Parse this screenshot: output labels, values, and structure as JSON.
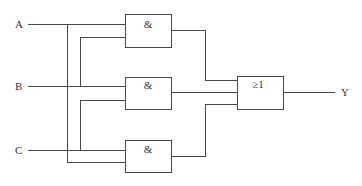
{
  "diagram": {
    "type": "logic-circuit",
    "inputs": [
      {
        "label": "A"
      },
      {
        "label": "B"
      },
      {
        "label": "C"
      }
    ],
    "gates": [
      {
        "id": "and1",
        "symbol": "&",
        "inputs": [
          "A",
          "B"
        ]
      },
      {
        "id": "and2",
        "symbol": "&",
        "inputs": [
          "B",
          "C"
        ]
      },
      {
        "id": "and3",
        "symbol": "&",
        "inputs": [
          "C",
          "A"
        ]
      },
      {
        "id": "or1",
        "symbol": "≥1",
        "inputs": [
          "and1",
          "and2",
          "and3"
        ]
      }
    ],
    "output": {
      "label": "Y"
    },
    "colors": {
      "line": "#4a4a4a",
      "text": "#333333"
    }
  }
}
